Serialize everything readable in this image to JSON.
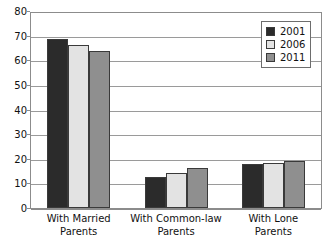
{
  "chart_data": {
    "type": "bar",
    "title": "",
    "xlabel": "",
    "ylabel": "",
    "ylim": [
      0,
      80
    ],
    "ytick_labels": [
      "80",
      "70",
      "60",
      "50",
      "40",
      "30",
      "20",
      "10",
      "0"
    ],
    "yticks": [
      80,
      70,
      60,
      50,
      40,
      30,
      20,
      10,
      0
    ],
    "grid": true,
    "legend_position": "top-right",
    "categories": [
      "With Married Parents",
      "With Common-law Parents",
      "With Lone Parents"
    ],
    "category_lines": [
      [
        "With Married",
        "Parents"
      ],
      [
        "With Common-law",
        "Parents"
      ],
      [
        "With Lone",
        "Parents"
      ]
    ],
    "series": [
      {
        "name": "2001",
        "color": "#2b2b2b",
        "values": [
          68.5,
          12.6,
          17.7
        ]
      },
      {
        "name": "2006",
        "color": "#e3e3e3",
        "values": [
          66.0,
          14.4,
          18.4
        ]
      },
      {
        "name": "2011",
        "color": "#8f8f8f",
        "values": [
          63.6,
          16.1,
          19.1
        ]
      }
    ]
  },
  "legend": {
    "items": [
      {
        "label": "2001",
        "color": "#2b2b2b"
      },
      {
        "label": "2006",
        "color": "#e3e3e3"
      },
      {
        "label": "2011",
        "color": "#8f8f8f"
      }
    ]
  },
  "colors": {
    "gridline": "#9a9a9a",
    "axis": "#8c8c8c",
    "bar_outline": "#3a3a3a",
    "text": "#111111",
    "background": "#ffffff"
  }
}
